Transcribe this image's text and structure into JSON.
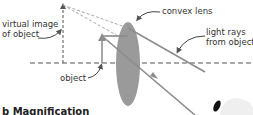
{
  "labels": {
    "virtual_image_line1": "virtual image",
    "virtual_image_line2": "of object",
    "convex_lens": "convex lens",
    "light_rays_line1": "light rays",
    "light_rays_line2": "from object",
    "object": "object",
    "section_title": "b  Magnification"
  },
  "colors": {
    "lens": "#9a9a9a",
    "rays": "#8c8c8c",
    "dashed": "#555555",
    "text": "#333333"
  }
}
